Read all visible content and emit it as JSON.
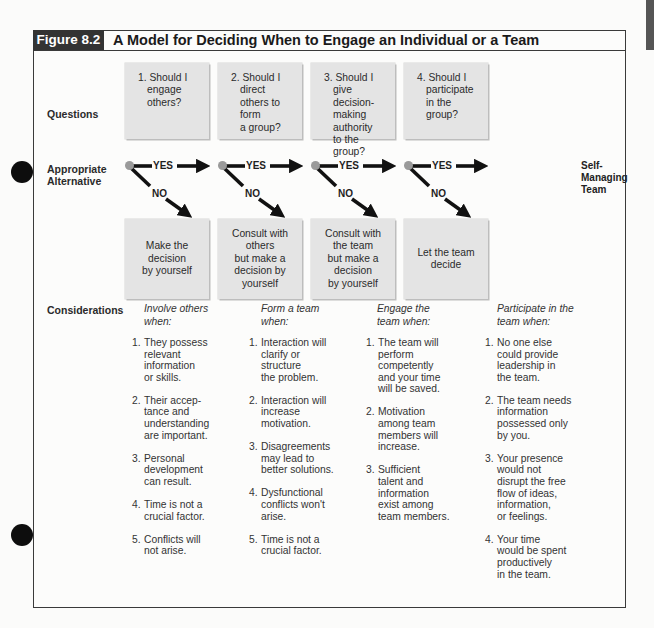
{
  "figure": {
    "label": "Figure 8.2",
    "title": "A Model for Deciding When to Engage an Individual or a Team"
  },
  "rows": {
    "questions": "Questions",
    "alternative": "Appropriate\nAlternative",
    "considerations": "Considerations"
  },
  "questions": [
    {
      "num": "1.",
      "text": "Should I\nengage others?"
    },
    {
      "num": "2.",
      "text": "Should I direct\nothers to form\na group?"
    },
    {
      "num": "3.",
      "text": "Should I\ngive decision-\nmaking authority\nto the group?"
    },
    {
      "num": "4.",
      "text": "Should I\nparticipate\nin the group?"
    }
  ],
  "branches": {
    "yes_label": "YES",
    "no_label": "NO",
    "final_yes_outcome": "Self-\nManaging\nTeam"
  },
  "alternatives": [
    "Make the\ndecision\nby yourself",
    "Consult with\nothers\nbut make a\ndecision by\nyourself",
    "Consult with\nthe team\nbut make a\ndecision\nby yourself",
    "Let the team\ndecide"
  ],
  "considerations": [
    {
      "heading": "Involve others\nwhen:",
      "items": [
        {
          "n": "1.",
          "t": "They possess\nrelevant\ninformation\nor skills."
        },
        {
          "n": "2.",
          "t": "Their accep-\ntance and\nunderstanding\nare important."
        },
        {
          "n": "3.",
          "t": "Personal\ndevelopment\ncan result."
        },
        {
          "n": "4.",
          "t": "Time is not a\ncrucial factor."
        },
        {
          "n": "5.",
          "t": "Conflicts will\nnot arise."
        }
      ]
    },
    {
      "heading": "Form a team\nwhen:",
      "items": [
        {
          "n": "1.",
          "t": "Interaction will\nclarify or\nstructure\nthe problem."
        },
        {
          "n": "2.",
          "t": "Interaction will\nincrease\nmotivation."
        },
        {
          "n": "3.",
          "t": "Disagreements\nmay lead to\nbetter solutions."
        },
        {
          "n": "4.",
          "t": "Dysfunctional\nconflicts won't\narise."
        },
        {
          "n": "5.",
          "t": "Time is not a\ncrucial factor."
        }
      ]
    },
    {
      "heading": "Engage the\nteam when:",
      "items": [
        {
          "n": "1.",
          "t": "The team will\nperform\ncompetently\nand your time\nwill be saved."
        },
        {
          "n": "2.",
          "t": "Motivation\namong team\nmembers will\nincrease."
        },
        {
          "n": "3.",
          "t": "Sufficient\ntalent and\ninformation\nexist among\nteam members."
        }
      ]
    },
    {
      "heading": "Participate in the\nteam when:",
      "items": [
        {
          "n": "1.",
          "t": "No one else\ncould provide\nleadership in\nthe team."
        },
        {
          "n": "2.",
          "t": "The team needs\ninformation\npossessed only\nby you."
        },
        {
          "n": "3.",
          "t": "Your presence\nwould not\ndisrupt the free\nflow of ideas,\ninformation,\nor feelings."
        },
        {
          "n": "4.",
          "t": "Your time\nwould be spent\nproductively\nin the team."
        }
      ]
    }
  ],
  "colors": {
    "header_label_bg": "#333333",
    "box_fill": "#e4e4e4",
    "start_dot": "#9a9a9a",
    "arrow": "#111111"
  }
}
